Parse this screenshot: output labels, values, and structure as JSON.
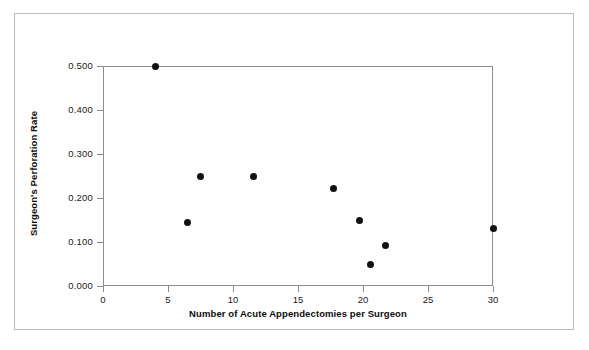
{
  "figure": {
    "background_color": "#fefefe",
    "frame_color": "#b9bcc0",
    "axis_color": "#8a8d91",
    "marker_color": "#111111"
  },
  "chart_data": {
    "type": "scatter",
    "title": "",
    "xlabel": "Number of Acute Appendectomies per Surgeon",
    "ylabel": "Surgeon's Perforation Rate",
    "xlim": [
      0,
      30
    ],
    "ylim": [
      0.0,
      0.5
    ],
    "grid": false,
    "legend": null,
    "xticks": [
      0,
      5,
      10,
      15,
      20,
      25,
      30
    ],
    "xtick_labels": [
      "0",
      "5",
      "10",
      "15",
      "20",
      "25",
      "30"
    ],
    "yticks": [
      0.0,
      0.1,
      0.2,
      0.3,
      0.4,
      0.5
    ],
    "ytick_labels": [
      "0.000",
      "0.100",
      "0.200",
      "0.300",
      "0.400",
      "0.500"
    ],
    "series": [
      {
        "name": "Surgeons",
        "marker": "filled-circle",
        "color": "#111111",
        "points": [
          {
            "x": 4,
            "y": 0.5
          },
          {
            "x": 6.5,
            "y": 0.145
          },
          {
            "x": 7.5,
            "y": 0.25
          },
          {
            "x": 11.6,
            "y": 0.25
          },
          {
            "x": 17.7,
            "y": 0.222
          },
          {
            "x": 19.7,
            "y": 0.15
          },
          {
            "x": 20.6,
            "y": 0.048
          },
          {
            "x": 21.7,
            "y": 0.093
          },
          {
            "x": 30,
            "y": 0.13
          }
        ]
      }
    ]
  }
}
